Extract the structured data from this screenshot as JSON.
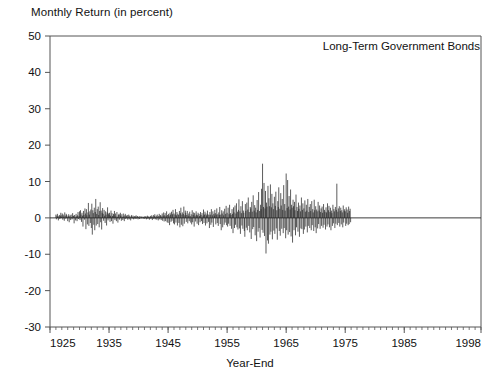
{
  "chart_data": {
    "type": "bar",
    "title": "Long-Term Government Bonds",
    "ylabel": "Monthly Return (in percent)",
    "xlabel": "Year-End",
    "ylim": [
      -30,
      50
    ],
    "xlim": [
      1925,
      1998
    ],
    "yticks": [
      50,
      40,
      30,
      20,
      10,
      0,
      -10,
      -20,
      -30
    ],
    "ytick_labels": [
      "50",
      "40",
      "30",
      "20",
      "10",
      "0",
      "-10",
      "-20",
      "-30"
    ],
    "xticks": [
      1925,
      1935,
      1945,
      1955,
      1965,
      1975,
      1985,
      1998
    ],
    "xtick_labels": [
      "1925",
      "1935",
      "1945",
      "1955",
      "1965",
      "1975",
      "1985",
      "1998"
    ],
    "x_minor_tick_interval": 1,
    "grid": false,
    "legend": "none",
    "baseline": 0,
    "series_name": "Long-Term Government Bonds monthly return",
    "series_color": "#262626",
    "axis_color": "#555555",
    "x_start": 1926.0,
    "x_step_months": 1,
    "values": [
      0.9,
      -0.4,
      0.6,
      1.1,
      0.3,
      -0.7,
      0.5,
      0.8,
      -0.3,
      0.6,
      1.4,
      0.2,
      0.7,
      1.2,
      -0.5,
      0.9,
      0.4,
      -0.8,
      1.5,
      0.6,
      -0.2,
      1.1,
      0.8,
      0.3,
      -0.9,
      0.5,
      1.0,
      -1.2,
      0.4,
      0.7,
      -0.6,
      0.9,
      0.2,
      -0.4,
      1.3,
      0.5,
      0.6,
      -1.5,
      0.8,
      0.3,
      -0.7,
      1.1,
      0.4,
      -0.9,
      0.7,
      1.6,
      -0.3,
      0.5,
      1.8,
      -0.6,
      2.1,
      0.9,
      -1.1,
      1.4,
      0.6,
      -2.4,
      1.9,
      0.8,
      -0.5,
      2.6,
      1.2,
      -3.1,
      2.4,
      0.7,
      -1.8,
      1.5,
      4.1,
      -2.2,
      0.9,
      1.8,
      -1.4,
      2.3,
      -2.8,
      3.9,
      -4.6,
      2.1,
      1.3,
      -1.9,
      2.8,
      -3.4,
      1.6,
      5.2,
      -2.1,
      1.1,
      2.4,
      -1.7,
      3.1,
      0.8,
      -2.6,
      1.9,
      4.3,
      -1.2,
      2.0,
      -3.2,
      1.4,
      2.7,
      1.1,
      -0.8,
      2.2,
      0.6,
      -1.4,
      1.8,
      0.9,
      -2.1,
      1.5,
      2.9,
      -0.7,
      1.2,
      0.8,
      1.4,
      -1.1,
      0.6,
      2.0,
      -0.9,
      1.3,
      0.5,
      -1.6,
      1.1,
      0.7,
      1.9,
      -0.6,
      1.2,
      0.4,
      -0.9,
      1.6,
      0.3,
      -1.3,
      0.8,
      1.1,
      -0.5,
      0.9,
      1.4,
      0.5,
      -0.8,
      1.0,
      0.3,
      -0.6,
      1.2,
      0.4,
      -0.9,
      0.7,
      1.1,
      -0.3,
      0.6,
      0.4,
      0.8,
      -0.5,
      0.3,
      0.9,
      -0.4,
      0.6,
      0.2,
      -0.7,
      0.5,
      0.8,
      -0.2,
      0.3,
      0.6,
      -0.4,
      0.2,
      0.5,
      -0.3,
      0.4,
      0.7,
      -0.2,
      0.3,
      0.5,
      -0.4,
      0.2,
      0.4,
      -0.3,
      0.5,
      0.1,
      -0.2,
      0.3,
      0.4,
      -0.1,
      0.2,
      0.3,
      -0.3,
      0.4,
      -0.2,
      0.3,
      0.5,
      -0.4,
      0.2,
      0.6,
      -0.3,
      0.4,
      0.2,
      -0.5,
      0.3,
      0.5,
      -0.3,
      0.7,
      0.2,
      -0.6,
      0.4,
      0.8,
      -0.3,
      0.5,
      1.0,
      -0.4,
      0.3,
      0.6,
      -0.5,
      0.9,
      0.3,
      -0.7,
      0.5,
      1.1,
      -0.4,
      0.6,
      0.8,
      -0.6,
      0.4,
      1.2,
      -0.8,
      0.6,
      1.5,
      -1.0,
      0.7,
      1.3,
      -0.9,
      0.5,
      1.8,
      -1.2,
      0.8,
      -1.4,
      1.1,
      0.6,
      -2.0,
      1.4,
      0.9,
      -1.1,
      1.7,
      -0.8,
      1.0,
      2.2,
      -1.5,
      1.2,
      -1.8,
      0.9,
      2.4,
      -1.3,
      0.7,
      1.6,
      -2.1,
      1.1,
      0.8,
      -1.4,
      1.9,
      -2.6,
      1.3,
      2.8,
      -1.9,
      0.9,
      1.5,
      -2.3,
      1.1,
      3.1,
      -1.6,
      0.7,
      2.0,
      1.4,
      -1.1,
      0.8,
      1.9,
      -1.5,
      0.6,
      1.2,
      -0.9,
      1.7,
      0.5,
      -1.3,
      1.0,
      -1.8,
      2.1,
      -1.2,
      0.8,
      1.5,
      -2.4,
      1.3,
      0.6,
      -1.0,
      1.8,
      0.9,
      -1.6,
      0.7,
      1.4,
      -2.0,
      1.1,
      0.5,
      -1.2,
      1.6,
      0.8,
      -0.9,
      1.3,
      -1.7,
      0.6,
      2.3,
      -1.4,
      0.9,
      1.7,
      -2.1,
      1.2,
      0.7,
      -1.5,
      2.0,
      1.0,
      -1.1,
      0.8,
      -2.8,
      1.6,
      0.9,
      -1.9,
      2.4,
      -1.3,
      0.7,
      1.8,
      -2.5,
      1.1,
      0.6,
      2.2,
      1.3,
      -1.8,
      0.9,
      2.6,
      -1.4,
      1.0,
      -2.2,
      1.5,
      0.8,
      3.0,
      -1.7,
      0.9,
      -3.4,
      2.1,
      1.2,
      -2.6,
      1.8,
      0.7,
      -1.9,
      2.5,
      -1.3,
      1.1,
      3.3,
      -2.0,
      1.4,
      -2.4,
      2.8,
      -1.6,
      1.0,
      3.6,
      -2.2,
      1.3,
      0.8,
      -3.0,
      2.4,
      1.1,
      -4.2,
      2.9,
      1.5,
      -2.8,
      3.4,
      -1.9,
      1.2,
      4.0,
      -2.6,
      1.7,
      -3.2,
      2.2,
      5.1,
      -2.9,
      1.8,
      -4.4,
      3.2,
      1.3,
      -2.1,
      4.6,
      -3.0,
      2.0,
      1.4,
      -3.6,
      -5.2,
      3.8,
      1.9,
      -2.7,
      4.2,
      -3.4,
      2.3,
      5.6,
      -2.2,
      1.6,
      -4.0,
      3.0,
      2.6,
      -5.8,
      4.4,
      1.7,
      -3.1,
      6.2,
      -2.5,
      2.0,
      3.5,
      -4.8,
      2.8,
      1.5,
      -6.4,
      4.9,
      2.2,
      -3.8,
      7.1,
      -2.8,
      1.9,
      -5.4,
      3.6,
      2.4,
      8.0,
      -3.3,
      14.9,
      -4.1,
      3.0,
      9.6,
      -5.0,
      2.6,
      7.4,
      -9.8,
      4.2,
      3.1,
      -6.2,
      8.8,
      -7.1,
      5.4,
      3.2,
      -4.6,
      9.2,
      -3.8,
      2.9,
      6.6,
      -5.9,
      4.0,
      2.4,
      -3.5,
      5.8,
      -4.4,
      3.3,
      7.2,
      -2.9,
      2.1,
      -6.0,
      4.6,
      3.0,
      8.4,
      -3.6,
      2.5,
      -4.9,
      6.8,
      3.4,
      -3.0,
      5.2,
      2.2,
      -4.2,
      9.0,
      -2.8,
      3.8,
      2.0,
      -5.6,
      12.2,
      -3.4,
      2.7,
      10.4,
      -4.6,
      3.1,
      6.0,
      -3.9,
      2.3,
      7.8,
      -5.1,
      3.6,
      2.8,
      -6.8,
      5.0,
      3.2,
      -3.4,
      4.4,
      2.1,
      -4.8,
      6.4,
      -2.6,
      3.0,
      1.9,
      -3.8,
      4.2,
      2.5,
      -5.2,
      3.4,
      1.8,
      -2.9,
      5.6,
      -3.1,
      2.2,
      4.0,
      -4.4,
      2.6,
      -3.2,
      4.8,
      1.7,
      -2.4,
      3.6,
      2.0,
      -4.0,
      5.2,
      -2.2,
      1.6,
      3.0,
      -2.8,
      3.8,
      1.9,
      -3.4,
      4.6,
      -2.0,
      2.4,
      1.5,
      -3.6,
      5.0,
      2.1,
      -2.6,
      3.2,
      -4.2,
      2.3,
      1.8,
      -2.9,
      4.4,
      -1.7,
      2.0,
      3.4,
      -3.0,
      1.6,
      2.6,
      -2.2,
      3.1,
      1.4,
      -2.7,
      3.8,
      -1.9,
      2.2,
      1.7,
      -3.2,
      2.9,
      1.5,
      -2.4,
      4.0,
      -1.8,
      2.1,
      3.3,
      -2.6,
      1.6,
      2.8,
      -3.4,
      2.0,
      1.3,
      -2.2,
      3.6,
      -1.5,
      2.4,
      1.8,
      -2.8,
      3.0,
      -1.6,
      2.2,
      9.4,
      -2.0,
      1.7,
      2.6,
      -1.4,
      3.2,
      -2.4,
      1.9,
      2.8,
      -1.8,
      2.1,
      1.5,
      -2.6,
      3.4,
      -1.3,
      2.0,
      2.4,
      1.8,
      -2.2,
      2.9,
      -1.6,
      2.3,
      1.4,
      -2.0,
      3.1,
      -1.7,
      1.9,
      2.5,
      -1.2
    ]
  }
}
